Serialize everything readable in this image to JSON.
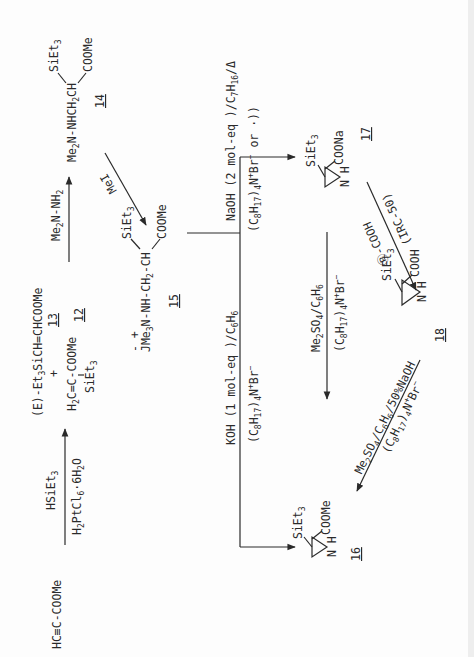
{
  "figure": {
    "orientation": "rotated-90-ccw",
    "compounds": {
      "start": {
        "formula": "HC≡C-COOMe"
      },
      "c13": {
        "formula": "(E)-Et3SiCH=CHCOOMe",
        "label": "13"
      },
      "plus": "+",
      "c12": {
        "formula_main": "H2C=C-COOMe",
        "substituent": "SiEt3",
        "label": "12"
      },
      "c14": {
        "formula_main": "Me2N-NHCH2CH",
        "sub_top": "SiEt3",
        "sub_bottom": "COOMe",
        "label": "14"
      },
      "c15": {
        "formula_main": "JMe3N-NH-CH2-CH",
        "charges": "- +",
        "sub_top": "SiEt3",
        "sub_bottom": "COOMe",
        "label": "15"
      },
      "c16": {
        "ring": "aziridine",
        "sub_top": "SiEt3",
        "sub_bottom": "COOMe",
        "nh": "N H",
        "label": "16"
      },
      "c17": {
        "ring": "aziridine",
        "sub_top": "SiEt3",
        "sub_bottom": "COONa",
        "nh": "N H",
        "label": "17"
      },
      "c18": {
        "ring": "aziridine",
        "sub_top": "SiEt3",
        "sub_bottom": "COOH",
        "nh": "N H",
        "label": "18"
      }
    },
    "reagents": {
      "hydrosilylation_top": "HSiEt3",
      "hydrosilylation_bottom": "H2PtCl6·6H2O",
      "hydrazine": "Me2N-NH2",
      "methylation": "MeI",
      "naoh_top": "NaOH (2 mol-eq)/C7H16/Δ",
      "naoh_bottom": "(C8H17)4NBr⁻ or ·))",
      "koh_top": "KOH (1 mol-eq)/C6H6",
      "koh_bottom": "(C8H17)4NBr⁻",
      "resin_top": "Ⓟ-COOH",
      "resin_bottom": "(IRC-50)",
      "dms_top": "Me2SO4/C6H6",
      "dms_bottom": "(C8H17)4NBr⁻",
      "dms2_top": "Me2SO4/C6H6/50%NaOH",
      "dms2_bottom": "(C8H17)4NBr⁻"
    }
  }
}
